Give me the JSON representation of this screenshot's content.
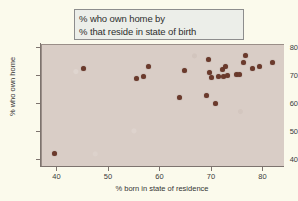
{
  "title": {
    "line1": "% who own home by",
    "line2": "% that reside in state of birth"
  },
  "colors": {
    "figure_background": "#fbfaec",
    "plot_background": "#d9cdc6",
    "marker": "#6b3a2c",
    "axis": "#7d736e",
    "title_box_fill": "#eceee9",
    "title_box_border": "#8d8d8d"
  },
  "chart_data": {
    "type": "scatter",
    "title": "% who own home by % that reside in state of birth",
    "xlabel": "% born in state of residence",
    "ylabel": "% who own home",
    "xlim": [
      37,
      84
    ],
    "ylim": [
      38,
      81
    ],
    "xticks": [
      40,
      50,
      60,
      70,
      80
    ],
    "yticks": [
      40,
      50,
      60,
      70,
      80
    ],
    "xtick_labels": [
      "40",
      "50",
      "60",
      "70",
      "80"
    ],
    "ytick_labels": [
      "40",
      "50",
      "60",
      "70",
      "80"
    ],
    "grid": false,
    "legend": false,
    "marker_size": 5,
    "points": [
      {
        "x": 39.5,
        "y": 42.4
      },
      {
        "x": 45.0,
        "y": 72.6
      },
      {
        "x": 55.3,
        "y": 69.2
      },
      {
        "x": 56.8,
        "y": 69.7
      },
      {
        "x": 57.6,
        "y": 73.2
      },
      {
        "x": 63.7,
        "y": 62.3
      },
      {
        "x": 64.6,
        "y": 71.8
      },
      {
        "x": 69.0,
        "y": 63.0
      },
      {
        "x": 69.3,
        "y": 75.9
      },
      {
        "x": 69.5,
        "y": 71.4
      },
      {
        "x": 70.0,
        "y": 69.4
      },
      {
        "x": 70.7,
        "y": 60.3
      },
      {
        "x": 71.3,
        "y": 69.8
      },
      {
        "x": 72.0,
        "y": 72.4
      },
      {
        "x": 72.2,
        "y": 69.9
      },
      {
        "x": 72.6,
        "y": 73.2
      },
      {
        "x": 73.0,
        "y": 70.1
      },
      {
        "x": 74.8,
        "y": 70.4
      },
      {
        "x": 75.3,
        "y": 70.6
      },
      {
        "x": 76.2,
        "y": 74.8
      },
      {
        "x": 76.5,
        "y": 77.4
      },
      {
        "x": 77.8,
        "y": 72.6
      },
      {
        "x": 79.3,
        "y": 73.4
      },
      {
        "x": 81.7,
        "y": 74.7
      }
    ]
  }
}
